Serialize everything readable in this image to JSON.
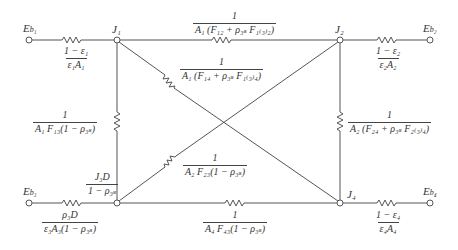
{
  "diagram": {
    "type": "radiation-network",
    "nodes": [
      {
        "id": "Eb1",
        "label": "E_b1",
        "x": 29,
        "y": 40
      },
      {
        "id": "J1",
        "label": "J_1",
        "x": 117,
        "y": 40
      },
      {
        "id": "J2",
        "label": "J_2",
        "x": 340,
        "y": 40
      },
      {
        "id": "Eb2",
        "label": "E_b2",
        "x": 430,
        "y": 40
      },
      {
        "id": "Eb3",
        "label": "E_b3",
        "x": 29,
        "y": 203
      },
      {
        "id": "J3D",
        "label": "J_3D / (1 − ρ_3s)",
        "x": 117,
        "y": 203
      },
      {
        "id": "J4",
        "label": "J_4",
        "x": 340,
        "y": 203
      },
      {
        "id": "Eb4",
        "label": "E_b4",
        "x": 430,
        "y": 203
      }
    ],
    "resistors": [
      {
        "from": "Eb1",
        "to": "J1",
        "num": "1 − ε₁",
        "den": "ε₁A₁"
      },
      {
        "from": "J1",
        "to": "J2",
        "num": "1",
        "den": "A₁(F₁₂ + ρ₃ₛF₁₍₃₎₂)"
      },
      {
        "from": "J2",
        "to": "Eb2",
        "num": "1 − ε₂",
        "den": "ε₂A₂"
      },
      {
        "from": "J1",
        "to": "J4",
        "num": "1",
        "den": "A₁(F₁₄ + ρ₃ₛF₁₍₃₎₄)"
      },
      {
        "from": "J1",
        "to": "J3D",
        "num": "1",
        "den": "A₁F₁₃(1 − ρ₃ₛ)"
      },
      {
        "from": "J2",
        "to": "J4",
        "num": "1",
        "den": "A₂(F₂₄ + ρ₃ₛF₂₍₃₎₄)"
      },
      {
        "from": "J3D",
        "to": "J2",
        "num": "1",
        "den": "A₂F₂₃(1 − ρ₃ₛ)"
      },
      {
        "from": "Eb3",
        "to": "J3D",
        "num": "ρ₃D",
        "den": "ε₃A₃(1 − ρ₃ₛ)"
      },
      {
        "from": "J3D",
        "to": "J4",
        "num": "1",
        "den": "A₄F₄₃(1 − ρ₃ₛ)"
      },
      {
        "from": "J4",
        "to": "Eb4",
        "num": "1 − ε₄",
        "den": "ε₄A₄"
      }
    ]
  },
  "labels": {
    "eb1": "E",
    "eb1_sub": "b₁",
    "eb2": "E",
    "eb2_sub": "b₂",
    "eb3": "E",
    "eb3_sub": "b₃",
    "eb4": "E",
    "eb4_sub": "b₄",
    "j1": "J₁",
    "j2": "J₂",
    "j4": "J₄",
    "j3d_num": "J₃D",
    "j3d_den": "1 − ρ₃ₛ"
  },
  "fractions": {
    "r_eb1_j1": {
      "num": "1 − ε₁",
      "den": "ε₁A₁"
    },
    "r_j1_j2": {
      "num": "1",
      "den": "A₁ (F₁₂ + ρ₃ₛ F₁₍₃₎₂)"
    },
    "r_j2_eb2": {
      "num": "1 − ε₂",
      "den": "ε₂A₂"
    },
    "r_j1_j4": {
      "num": "1",
      "den": "A₁ (F₁₄ + ρ₃ₛ F₁₍₃₎₄)"
    },
    "r_j1_j3": {
      "num": "1",
      "den": "A₁ F₁₃(1 − ρ₃ₛ)"
    },
    "r_j2_j4": {
      "num": "1",
      "den": "A₂ (F₂₄ + ρ₃ₛ F₂₍₃₎₄)"
    },
    "r_j3_j2": {
      "num": "1",
      "den": "A₂ F₂₃(1 − ρ₃ₛ)"
    },
    "r_eb3_j3": {
      "num": "ρ₃D",
      "den": "ε₃A₃(1 − ρ₃ₛ)"
    },
    "r_j3_j4": {
      "num": "1",
      "den": "A₄ F₄₃(1 − ρ₃ₛ)"
    },
    "r_j4_eb4": {
      "num": "1 − ε₄",
      "den": "ε₄A₄"
    }
  },
  "colors": {
    "line": "#555555",
    "text": "#333333"
  }
}
